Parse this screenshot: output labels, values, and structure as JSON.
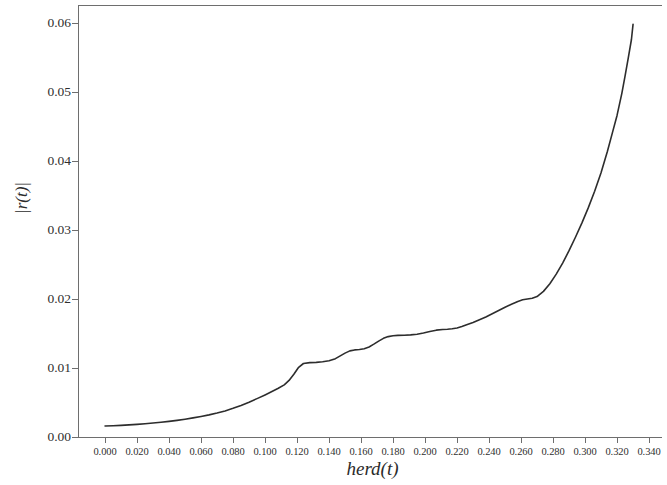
{
  "chart_data": {
    "type": "line",
    "title": "",
    "subtitle": "",
    "xlabel": "herd(t)",
    "ylabel": "|r(t)|",
    "xlim": [
      -0.0169,
      0.3481
    ],
    "ylim": [
      0.0,
      0.0626
    ],
    "grid": false,
    "legend": null,
    "x_tick_labels": [
      "0.000",
      "0.020",
      "0.040",
      "0.060",
      "0.080",
      "0.100",
      "0.120",
      "0.140",
      "0.160",
      "0.180",
      "0.200",
      "0.220",
      "0.240",
      "0.260",
      "0.280",
      "0.300",
      "0.320",
      "0.340"
    ],
    "x_ticks": [
      0.0,
      0.02,
      0.04,
      0.06,
      0.08,
      0.1,
      0.12,
      0.14,
      0.16,
      0.18,
      0.2,
      0.22,
      0.24,
      0.26,
      0.28,
      0.3,
      0.32,
      0.34
    ],
    "y_tick_labels": [
      "0.00",
      "0.01",
      "0.02",
      "0.03",
      "0.04",
      "0.05",
      "0.06"
    ],
    "y_ticks": [
      0.0,
      0.01,
      0.02,
      0.03,
      0.04,
      0.05,
      0.06
    ],
    "series": [
      {
        "name": "|r(t)| vs herd(t)",
        "color": "#2d2d2d",
        "line_width": 1.6,
        "x": [
          0.0,
          0.005,
          0.01,
          0.015,
          0.02,
          0.025,
          0.03,
          0.035,
          0.04,
          0.045,
          0.05,
          0.055,
          0.06,
          0.065,
          0.07,
          0.075,
          0.08,
          0.085,
          0.09,
          0.095,
          0.1,
          0.104,
          0.108,
          0.112,
          0.115,
          0.118,
          0.121,
          0.124,
          0.128,
          0.132,
          0.136,
          0.14,
          0.144,
          0.147,
          0.15,
          0.153,
          0.156,
          0.159,
          0.162,
          0.165,
          0.168,
          0.171,
          0.174,
          0.177,
          0.18,
          0.183,
          0.187,
          0.191,
          0.195,
          0.199,
          0.203,
          0.207,
          0.211,
          0.214,
          0.217,
          0.22,
          0.223,
          0.226,
          0.23,
          0.234,
          0.238,
          0.242,
          0.246,
          0.25,
          0.254,
          0.258,
          0.261,
          0.264,
          0.267,
          0.27,
          0.274,
          0.278,
          0.282,
          0.286,
          0.29,
          0.294,
          0.298,
          0.302,
          0.306,
          0.31,
          0.314,
          0.317,
          0.32,
          0.323,
          0.325,
          0.327,
          0.329,
          0.33
        ],
        "y": [
          0.0016,
          0.00163,
          0.00168,
          0.00175,
          0.00183,
          0.00192,
          0.00202,
          0.00213,
          0.00226,
          0.00241,
          0.00258,
          0.00277,
          0.00298,
          0.00321,
          0.00347,
          0.00378,
          0.00415,
          0.00458,
          0.00505,
          0.00556,
          0.0061,
          0.00655,
          0.00702,
          0.00755,
          0.0082,
          0.0091,
          0.0101,
          0.01065,
          0.01078,
          0.01082,
          0.0109,
          0.01105,
          0.01135,
          0.01175,
          0.01215,
          0.01248,
          0.01262,
          0.01268,
          0.0128,
          0.01305,
          0.01345,
          0.0139,
          0.0143,
          0.01455,
          0.01468,
          0.01472,
          0.01475,
          0.0148,
          0.0149,
          0.01508,
          0.0153,
          0.01548,
          0.01558,
          0.01562,
          0.01568,
          0.0158,
          0.016,
          0.01625,
          0.0166,
          0.017,
          0.0174,
          0.01785,
          0.01832,
          0.0188,
          0.01925,
          0.01965,
          0.01988,
          0.02,
          0.0201,
          0.02035,
          0.0211,
          0.0222,
          0.0236,
          0.0252,
          0.027,
          0.02895,
          0.031,
          0.0332,
          0.0356,
          0.0383,
          0.0414,
          0.044,
          0.0466,
          0.0498,
          0.0523,
          0.0549,
          0.0576,
          0.0598
        ]
      }
    ]
  },
  "axis": {
    "x_title": "herd(t)",
    "y_title": "|r(t)|"
  }
}
